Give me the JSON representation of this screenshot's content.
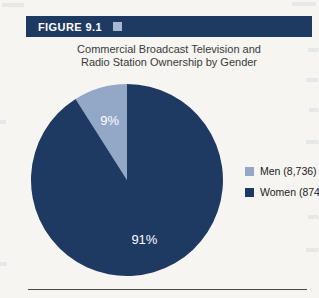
{
  "figure": {
    "label": "FIGURE 9.1",
    "title_line1": "Commercial Broadcast Television and",
    "title_line2": "Radio Station Ownership by Gender"
  },
  "colors": {
    "navy": "#1e3a63",
    "light_blue": "#93a7c7",
    "header_icon": "#a9b8d2",
    "background": "#f6f5f1",
    "slice_label_text": "#ffffff",
    "rule": "#4a4a4a"
  },
  "chart_data": {
    "type": "pie",
    "title": "Commercial Broadcast Television and Radio Station Ownership by Gender",
    "categories": [
      "Men",
      "Women"
    ],
    "values": [
      9,
      91
    ],
    "value_labels": [
      "9%",
      "91%"
    ],
    "counts": [
      "8,736",
      "874"
    ],
    "slice_colors": [
      "#93a7c7",
      "#1e3a63"
    ],
    "legend_position": "right",
    "legend": [
      {
        "label": "Men (8,736)",
        "color": "#93a7c7"
      },
      {
        "label": "Women (874)",
        "color": "#1e3a63"
      }
    ]
  }
}
